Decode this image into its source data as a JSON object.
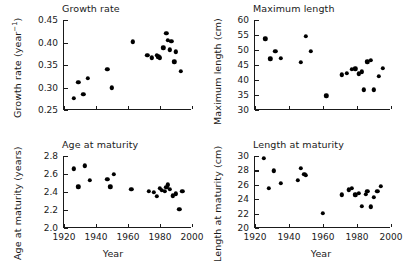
{
  "figure": {
    "background": "#ffffff",
    "marker_color": "#000000",
    "axis_color": "#1a1a1a"
  },
  "chart_data": [
    {
      "type": "scatter",
      "panel": "top-left",
      "title": "Growth rate",
      "xlabel": "",
      "ylabel": "Growth rate (year⁻¹)",
      "xlim": [
        1920,
        2000
      ],
      "ylim": [
        0.25,
        0.45
      ],
      "xticks": [
        1920,
        1940,
        1960,
        1980,
        2000
      ],
      "xtick_labels": [
        "",
        "",
        "",
        "",
        ""
      ],
      "yticks": [
        0.25,
        0.3,
        0.35,
        0.4,
        0.45
      ],
      "ytick_labels": [
        "0.25",
        "0.30",
        "0.35",
        "0.40",
        "0.45"
      ],
      "grid": false,
      "legend": "none",
      "x": [
        1926,
        1929,
        1932,
        1935,
        1947,
        1950,
        1963,
        1972,
        1975,
        1978,
        1979,
        1980,
        1982,
        1984,
        1985,
        1986,
        1987,
        1989,
        1990,
        1993
      ],
      "y": [
        0.274,
        0.309,
        0.283,
        0.318,
        0.339,
        0.297,
        0.4,
        0.369,
        0.364,
        0.369,
        0.366,
        0.364,
        0.386,
        0.419,
        0.403,
        0.382,
        0.401,
        0.355,
        0.377,
        0.334
      ]
    },
    {
      "type": "scatter",
      "panel": "top-right",
      "title": "Maximum length",
      "xlabel": "",
      "ylabel": "Maximum length (cm)",
      "xlim": [
        1920,
        2000
      ],
      "ylim": [
        30,
        60
      ],
      "xticks": [
        1920,
        1940,
        1960,
        1980,
        2000
      ],
      "xtick_labels": [
        "",
        "",
        "",
        "",
        ""
      ],
      "yticks": [
        30,
        35,
        40,
        45,
        50,
        55,
        60
      ],
      "ytick_labels": [
        "30",
        "35",
        "40",
        "45",
        "50",
        "55",
        "60"
      ],
      "grid": false,
      "legend": "none",
      "x": [
        1926,
        1929,
        1932,
        1935,
        1947,
        1950,
        1953,
        1962,
        1971,
        1974,
        1977,
        1979,
        1981,
        1983,
        1984,
        1986,
        1988,
        1990,
        1993,
        1995
      ],
      "y": [
        53.5,
        46.8,
        49.3,
        47.0,
        45.6,
        54.3,
        49.2,
        34.4,
        41.5,
        42.0,
        43.3,
        43.5,
        41.8,
        42.4,
        36.4,
        45.8,
        46.2,
        36.5,
        40.9,
        43.7
      ]
    },
    {
      "type": "scatter",
      "panel": "bottom-left",
      "title": "Age at maturity",
      "xlabel": "Year",
      "ylabel": "Age at maturity (years)",
      "xlim": [
        1920,
        2000
      ],
      "ylim": [
        2.0,
        2.8
      ],
      "xticks": [
        1920,
        1940,
        1960,
        1980,
        2000
      ],
      "xtick_labels": [
        "1920",
        "1940",
        "1960",
        "1980",
        "2000"
      ],
      "yticks": [
        2.0,
        2.2,
        2.4,
        2.6,
        2.8
      ],
      "ytick_labels": [
        "2.0",
        "2.2",
        "2.4",
        "2.6",
        "2.8"
      ],
      "grid": false,
      "legend": "none",
      "x": [
        1926,
        1929,
        1933,
        1936,
        1947,
        1949,
        1951,
        1962,
        1973,
        1976,
        1978,
        1980,
        1981,
        1983,
        1984,
        1985,
        1986,
        1988,
        1990,
        1992,
        1994
      ],
      "y": [
        2.65,
        2.45,
        2.68,
        2.52,
        2.53,
        2.45,
        2.59,
        2.42,
        2.4,
        2.39,
        2.34,
        2.43,
        2.41,
        2.4,
        2.44,
        2.47,
        2.42,
        2.35,
        2.37,
        2.2,
        2.4
      ]
    },
    {
      "type": "scatter",
      "panel": "bottom-right",
      "title": "Length at maturity",
      "xlabel": "Year",
      "ylabel": "Length at maturity (cm)",
      "xlim": [
        1920,
        2000
      ],
      "ylim": [
        20,
        30
      ],
      "xticks": [
        1920,
        1940,
        1960,
        1980,
        2000
      ],
      "xtick_labels": [
        "1920",
        "1940",
        "1960",
        "1980",
        "2000"
      ],
      "yticks": [
        20,
        22,
        24,
        26,
        28,
        30
      ],
      "ytick_labels": [
        "20",
        "22",
        "24",
        "26",
        "28",
        "30"
      ],
      "grid": false,
      "legend": "none",
      "x": [
        1925,
        1928,
        1931,
        1935,
        1945,
        1947,
        1949,
        1950,
        1960,
        1971,
        1975,
        1977,
        1979,
        1981,
        1983,
        1985,
        1986,
        1988,
        1990,
        1992,
        1994
      ],
      "y": [
        29.6,
        25.4,
        27.8,
        26.1,
        26.5,
        28.2,
        27.3,
        27.2,
        21.9,
        24.5,
        25.2,
        25.4,
        24.5,
        24.7,
        22.9,
        24.6,
        25.0,
        22.8,
        24.1,
        25.0,
        25.7
      ]
    }
  ]
}
